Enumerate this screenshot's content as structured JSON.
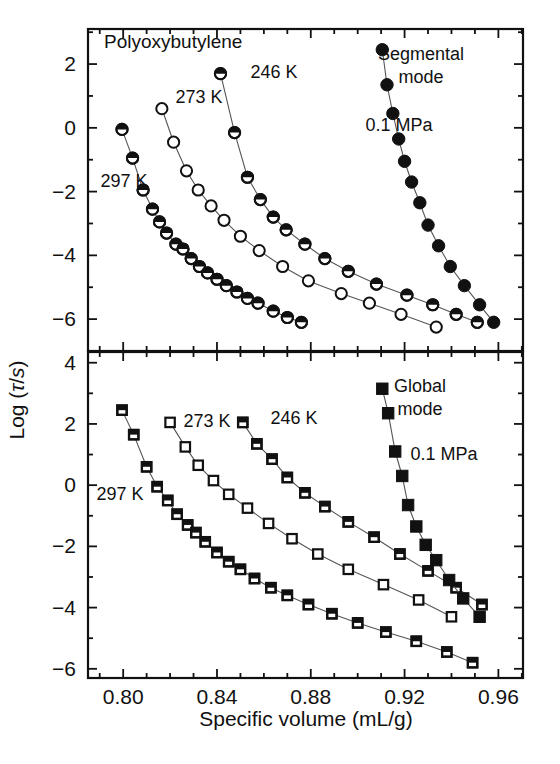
{
  "figure": {
    "title": "Polyoxybutylene",
    "xlabel": "Specific volume (mL/g)",
    "ylabel_prefix": "Log (",
    "ylabel_tau": "τ",
    "ylabel_mid": "/",
    "ylabel_s": "s",
    "ylabel_suffix": ")"
  },
  "panels": {
    "upper": {
      "name": "Segmental mode",
      "name_line1": "Segmental",
      "name_line2": "mode",
      "pressure_label": "0.1 MPa",
      "series_labels": {
        "t297": "297 K",
        "t273": "273 K",
        "t246": "246 K"
      }
    },
    "lower": {
      "name": "Global mode",
      "name_line1": "Global",
      "name_line2": "mode",
      "pressure_label": "0.1 MPa",
      "series_labels": {
        "t297": "297 K",
        "t273": "273 K",
        "t246": "246 K"
      }
    }
  },
  "axes": {
    "x": {
      "min": 0.785,
      "max": 0.9705,
      "major_ticks": [
        0.8,
        0.84,
        0.88,
        0.92,
        0.96
      ],
      "major_tick_labels": [
        "0.80",
        "0.84",
        "0.88",
        "0.92",
        "0.96"
      ],
      "minor_step": 0.01
    },
    "y_upper": {
      "min": -7.0,
      "max": 3.1,
      "major_ticks": [
        2,
        0,
        -2,
        -4,
        -6
      ],
      "major_tick_labels": [
        "2",
        "0",
        "−2",
        "−4",
        "−6"
      ],
      "minor_step": 1
    },
    "y_lower": {
      "min": -6.3,
      "max": 4.35,
      "major_ticks": [
        4,
        2,
        0,
        -2,
        -4,
        -6
      ],
      "major_tick_labels": [
        "4",
        "2",
        "0",
        "−2",
        "−4",
        "−6"
      ],
      "minor_step": 1
    }
  },
  "chart_data": {
    "type": "scatter",
    "title": "Polyoxybutylene",
    "xlabel": "Specific volume (mL/g)",
    "ylabel": "Log (τ/s)",
    "grid": false,
    "legend": "in-plot annotations",
    "subplots": [
      {
        "panel": "upper",
        "panel_label": "Segmental mode",
        "xlim": [
          0.785,
          0.9705
        ],
        "ylim": [
          -7.0,
          3.1
        ],
        "series": [
          {
            "name": "297 K",
            "marker": "half-filled-circle",
            "x": [
              0.7995,
              0.804,
              0.8085,
              0.8125,
              0.8155,
              0.8185,
              0.8225,
              0.8255,
              0.829,
              0.8325,
              0.836,
              0.84,
              0.844,
              0.8485,
              0.853,
              0.8575,
              0.864,
              0.87,
              0.876
            ],
            "y": [
              -0.05,
              -0.95,
              -1.95,
              -2.55,
              -2.95,
              -3.3,
              -3.65,
              -3.8,
              -4.1,
              -4.35,
              -4.55,
              -4.75,
              -4.95,
              -5.15,
              -5.35,
              -5.5,
              -5.75,
              -5.95,
              -6.1
            ]
          },
          {
            "name": "273 K",
            "marker": "open-circle",
            "x": [
              0.8165,
              0.8215,
              0.827,
              0.832,
              0.8375,
              0.843,
              0.85,
              0.858,
              0.868,
              0.879,
              0.893,
              0.905,
              0.9185,
              0.9335
            ],
            "y": [
              0.6,
              -0.45,
              -1.35,
              -1.95,
              -2.45,
              -2.9,
              -3.4,
              -3.85,
              -4.35,
              -4.8,
              -5.2,
              -5.5,
              -5.85,
              -6.25
            ]
          },
          {
            "name": "246 K",
            "marker": "half-filled-circle",
            "x": [
              0.8415,
              0.8475,
              0.853,
              0.8585,
              0.864,
              0.8695,
              0.8775,
              0.886,
              0.896,
              0.908,
              0.921,
              0.932,
              0.942,
              0.951
            ],
            "y": [
              1.7,
              -0.15,
              -1.55,
              -2.25,
              -2.8,
              -3.2,
              -3.65,
              -4.1,
              -4.5,
              -4.9,
              -5.25,
              -5.55,
              -5.85,
              -6.1
            ]
          },
          {
            "name": "0.1 MPa",
            "marker": "filled-circle",
            "x": [
              0.9105,
              0.9125,
              0.915,
              0.9175,
              0.92,
              0.923,
              0.9265,
              0.93,
              0.9345,
              0.9395,
              0.9455,
              0.952,
              0.958
            ],
            "y": [
              2.45,
              1.35,
              0.45,
              -0.35,
              -1.05,
              -1.7,
              -2.35,
              -3.05,
              -3.7,
              -4.35,
              -4.95,
              -5.55,
              -6.1
            ]
          }
        ]
      },
      {
        "panel": "lower",
        "panel_label": "Global mode",
        "xlim": [
          0.785,
          0.9705
        ],
        "ylim": [
          -6.3,
          4.35
        ],
        "series": [
          {
            "name": "297 K",
            "marker": "half-filled-square",
            "x": [
              0.7995,
              0.8045,
              0.81,
              0.8145,
              0.819,
              0.823,
              0.8275,
              0.831,
              0.835,
              0.84,
              0.845,
              0.85,
              0.856,
              0.863,
              0.87,
              0.879,
              0.889,
              0.9,
              0.912,
              0.925,
              0.938,
              0.949
            ],
            "y": [
              2.45,
              1.65,
              0.6,
              -0.05,
              -0.5,
              -0.95,
              -1.3,
              -1.55,
              -1.85,
              -2.2,
              -2.5,
              -2.75,
              -3.05,
              -3.35,
              -3.6,
              -3.9,
              -4.2,
              -4.5,
              -4.8,
              -5.1,
              -5.45,
              -5.8
            ]
          },
          {
            "name": "273 K",
            "marker": "open-square",
            "x": [
              0.82,
              0.8265,
              0.832,
              0.8385,
              0.845,
              0.853,
              0.862,
              0.872,
              0.883,
              0.896,
              0.911,
              0.926,
              0.94
            ],
            "y": [
              2.05,
              1.25,
              0.65,
              0.15,
              -0.3,
              -0.75,
              -1.25,
              -1.75,
              -2.25,
              -2.75,
              -3.25,
              -3.75,
              -4.3
            ]
          },
          {
            "name": "246 K",
            "marker": "half-filled-square",
            "x": [
              0.851,
              0.857,
              0.8635,
              0.87,
              0.8775,
              0.886,
              0.896,
              0.907,
              0.918,
              0.93,
              0.942,
              0.953
            ],
            "y": [
              2.05,
              1.35,
              0.85,
              0.25,
              -0.25,
              -0.7,
              -1.2,
              -1.7,
              -2.25,
              -2.8,
              -3.35,
              -3.9
            ]
          },
          {
            "name": "0.1 MPa",
            "marker": "filled-square",
            "x": [
              0.9105,
              0.913,
              0.916,
              0.919,
              0.9215,
              0.925,
              0.929,
              0.9335,
              0.939,
              0.945,
              0.952
            ],
            "y": [
              3.15,
              2.35,
              1.1,
              0.3,
              -0.65,
              -1.35,
              -1.95,
              -2.45,
              -3.1,
              -3.7,
              -4.3
            ]
          }
        ]
      }
    ]
  }
}
